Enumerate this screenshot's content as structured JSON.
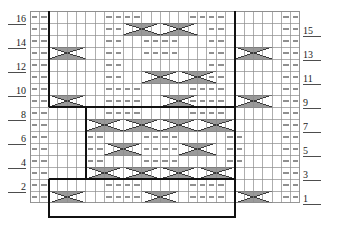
{
  "chart_data": {
    "type": "table",
    "title": "",
    "subtitle": "",
    "xlabel": "",
    "ylabel": "",
    "grid": true,
    "legend": "none",
    "columns": 29,
    "rows": 16,
    "row_numbers_left": [
      "16",
      "14",
      "12",
      "10",
      "8",
      "6",
      "4",
      "2"
    ],
    "row_numbers_right": [
      "15",
      "13",
      "11",
      "9",
      "7",
      "5",
      "3",
      "1"
    ],
    "symbol_legend": {
      "dash": "purl-stitch",
      "x_cross": "cable-cross"
    },
    "colors": {
      "grid_line": "#8c8c8c",
      "bold_line": "#111111",
      "cable_fill": "#9a9a9a",
      "cable_stroke": "#333333",
      "dash_fill": "#8f8f8f",
      "text": "#1a1a1a",
      "background": "#ffffff"
    },
    "dash_cells": [
      {
        "row": 16,
        "cols": [
          0,
          1
        ]
      },
      {
        "row": 16,
        "cols": [
          8,
          9,
          10,
          11
        ]
      },
      {
        "row": 16,
        "cols": [
          17,
          18,
          19,
          20
        ]
      },
      {
        "row": 16,
        "cols": [
          27,
          28
        ]
      },
      {
        "row": 15,
        "cols": [
          0,
          1
        ]
      },
      {
        "row": 15,
        "cols": [
          8,
          9
        ]
      },
      {
        "row": 15,
        "cols": [
          19,
          20
        ]
      },
      {
        "row": 15,
        "cols": [
          27,
          28
        ]
      },
      {
        "row": 14,
        "cols": [
          0,
          1
        ]
      },
      {
        "row": 14,
        "cols": [
          8,
          9
        ]
      },
      {
        "row": 14,
        "cols": [
          12,
          13,
          14,
          15
        ]
      },
      {
        "row": 14,
        "cols": [
          19,
          20
        ]
      },
      {
        "row": 14,
        "cols": [
          27,
          28
        ]
      },
      {
        "row": 13,
        "cols": [
          0,
          1
        ]
      },
      {
        "row": 13,
        "cols": [
          8,
          9
        ]
      },
      {
        "row": 13,
        "cols": [
          12,
          13,
          14,
          15
        ]
      },
      {
        "row": 13,
        "cols": [
          19,
          20
        ]
      },
      {
        "row": 13,
        "cols": [
          27,
          28
        ]
      },
      {
        "row": 12,
        "cols": [
          0,
          1
        ]
      },
      {
        "row": 12,
        "cols": [
          8,
          9
        ]
      },
      {
        "row": 12,
        "cols": [
          19,
          20
        ]
      },
      {
        "row": 12,
        "cols": [
          27,
          28
        ]
      },
      {
        "row": 11,
        "cols": [
          0,
          1
        ]
      },
      {
        "row": 11,
        "cols": [
          8,
          9
        ]
      },
      {
        "row": 11,
        "cols": [
          19,
          20
        ]
      },
      {
        "row": 11,
        "cols": [
          27,
          28
        ]
      },
      {
        "row": 10,
        "cols": [
          0,
          1
        ]
      },
      {
        "row": 10,
        "cols": [
          8,
          9,
          10,
          11
        ]
      },
      {
        "row": 10,
        "cols": [
          17,
          18,
          19,
          20
        ]
      },
      {
        "row": 10,
        "cols": [
          27,
          28
        ]
      },
      {
        "row": 9,
        "cols": [
          0,
          1
        ]
      },
      {
        "row": 9,
        "cols": [
          8,
          9,
          10,
          11
        ]
      },
      {
        "row": 9,
        "cols": [
          17,
          18,
          19,
          20
        ]
      },
      {
        "row": 9,
        "cols": [
          27,
          28
        ]
      },
      {
        "row": 8,
        "cols": [
          0,
          1
        ]
      },
      {
        "row": 8,
        "cols": [
          8,
          9,
          10,
          11
        ]
      },
      {
        "row": 8,
        "cols": [
          17,
          18,
          19,
          20
        ]
      },
      {
        "row": 8,
        "cols": [
          27,
          28
        ]
      },
      {
        "row": 7,
        "cols": [
          0,
          1
        ]
      },
      {
        "row": 7,
        "cols": [
          27,
          28
        ]
      },
      {
        "row": 6,
        "cols": [
          0,
          1
        ]
      },
      {
        "row": 6,
        "cols": [
          6,
          7
        ]
      },
      {
        "row": 6,
        "cols": [
          12,
          13,
          14,
          15
        ]
      },
      {
        "row": 6,
        "cols": [
          21,
          22
        ]
      },
      {
        "row": 6,
        "cols": [
          27,
          28
        ]
      },
      {
        "row": 5,
        "cols": [
          0,
          1
        ]
      },
      {
        "row": 5,
        "cols": [
          6,
          7
        ]
      },
      {
        "row": 5,
        "cols": [
          12,
          13,
          14,
          15
        ]
      },
      {
        "row": 5,
        "cols": [
          21,
          22
        ]
      },
      {
        "row": 5,
        "cols": [
          27,
          28
        ]
      },
      {
        "row": 4,
        "cols": [
          0,
          1
        ]
      },
      {
        "row": 4,
        "cols": [
          6,
          7
        ]
      },
      {
        "row": 4,
        "cols": [
          12,
          13,
          14,
          15
        ]
      },
      {
        "row": 4,
        "cols": [
          21,
          22
        ]
      },
      {
        "row": 4,
        "cols": [
          27,
          28
        ]
      },
      {
        "row": 3,
        "cols": [
          0,
          1
        ]
      },
      {
        "row": 3,
        "cols": [
          27,
          28
        ]
      },
      {
        "row": 2,
        "cols": [
          0,
          1
        ]
      },
      {
        "row": 2,
        "cols": [
          8,
          9,
          10,
          11
        ]
      },
      {
        "row": 2,
        "cols": [
          17,
          18,
          19,
          20
        ]
      },
      {
        "row": 2,
        "cols": [
          27,
          28
        ]
      },
      {
        "row": 1,
        "cols": [
          0,
          1
        ]
      },
      {
        "row": 1,
        "cols": [
          8,
          9,
          10,
          11
        ]
      },
      {
        "row": 1,
        "cols": [
          17,
          18,
          19,
          20
        ]
      },
      {
        "row": 1,
        "cols": [
          27,
          28
        ]
      }
    ],
    "cable_cells": [
      {
        "row": 15,
        "col": 10,
        "span": 4,
        "dir": "right"
      },
      {
        "row": 15,
        "col": 14,
        "span": 4,
        "dir": "left"
      },
      {
        "row": 13,
        "col": 2,
        "span": 4,
        "dir": "left"
      },
      {
        "row": 13,
        "col": 22,
        "span": 4,
        "dir": "left"
      },
      {
        "row": 11,
        "col": 12,
        "span": 4,
        "dir": "right"
      },
      {
        "row": 11,
        "col": 16,
        "span": 4,
        "dir": "left"
      },
      {
        "row": 9,
        "col": 2,
        "span": 4,
        "dir": "left"
      },
      {
        "row": 9,
        "col": 14,
        "span": 4,
        "dir": "left"
      },
      {
        "row": 9,
        "col": 22,
        "span": 4,
        "dir": "left"
      },
      {
        "row": 7,
        "col": 6,
        "span": 4,
        "dir": "right"
      },
      {
        "row": 7,
        "col": 10,
        "span": 4,
        "dir": "left"
      },
      {
        "row": 7,
        "col": 14,
        "span": 4,
        "dir": "right"
      },
      {
        "row": 7,
        "col": 18,
        "span": 4,
        "dir": "left"
      },
      {
        "row": 5,
        "col": 8,
        "span": 4,
        "dir": "left"
      },
      {
        "row": 5,
        "col": 16,
        "span": 4,
        "dir": "left"
      },
      {
        "row": 3,
        "col": 6,
        "span": 4,
        "dir": "right"
      },
      {
        "row": 3,
        "col": 10,
        "span": 4,
        "dir": "left"
      },
      {
        "row": 3,
        "col": 14,
        "span": 4,
        "dir": "right"
      },
      {
        "row": 3,
        "col": 18,
        "span": 4,
        "dir": "left"
      },
      {
        "row": 1,
        "col": 2,
        "span": 4,
        "dir": "left"
      },
      {
        "row": 1,
        "col": 12,
        "span": 4,
        "dir": "left"
      },
      {
        "row": 1,
        "col": 22,
        "span": 4,
        "dir": "left"
      }
    ],
    "bold_outlines": [
      {
        "name": "left-panel-border",
        "col": 2,
        "row_bottom": 8,
        "row_top": 16
      },
      {
        "name": "right-panel-border",
        "col": 22,
        "row_bottom": 8,
        "row_top": 16
      },
      {
        "name": "center-box",
        "col_start": 6,
        "col_end": 22,
        "row_bottom": 3,
        "row_top": 8
      },
      {
        "name": "repeat-box",
        "col_start": 2,
        "col_end": 22,
        "row_bottom": 0,
        "row_top": 2
      }
    ]
  }
}
